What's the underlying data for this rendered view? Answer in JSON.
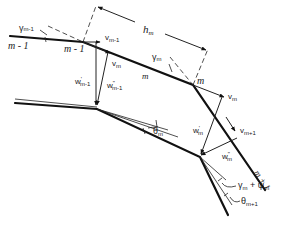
{
  "diagram": {
    "nodes": {
      "m_minus_1_left": "m - 1",
      "m_minus_1_node": "m - 1",
      "m_segment": "m",
      "m_node": "m",
      "m_plus_1": "m + 1"
    },
    "labels": {
      "gamma_m_minus_1": "γ",
      "gamma_m_minus_1_sub": "m-1",
      "h_m": "h",
      "h_m_sub": "m",
      "v_m_minus_1": "v",
      "v_m_minus_1_sub": "m-1",
      "v_m_upper": "v",
      "v_m_upper_sub": "m",
      "gamma_m": "γ",
      "gamma_m_sub": "m",
      "v_m_right": "v",
      "v_m_right_sub": "m",
      "w_prime_m_minus_1": "w",
      "w_prime_m_minus_1_sup": "'",
      "w_prime_m_minus_1_sub": "m-1",
      "w_dprime_m_minus_1": "w",
      "w_dprime_m_minus_1_sup": "\"",
      "w_dprime_m_minus_1_sub": "m-1",
      "theta_m": "θ",
      "theta_m_sub": "m",
      "w_prime_m": "w",
      "w_prime_m_sup": "'",
      "w_prime_m_sub": "m",
      "v_m_plus_1": "v",
      "v_m_plus_1_sub": "m+1",
      "w_dprime_m": "w",
      "w_dprime_m_sup": "\"",
      "w_dprime_m_sub": "m",
      "gamma_plus_psi": "γ",
      "gamma_plus_psi_sub1": "m",
      "gamma_plus_psi_mid": " + ψ",
      "gamma_plus_psi_sub2": "m",
      "theta_m_plus_1": "θ",
      "theta_m_plus_1_sub": "m+1"
    },
    "colors": {
      "ink": "#111111",
      "background": "#ffffff"
    }
  }
}
